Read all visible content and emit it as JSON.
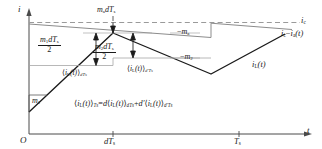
{
  "figure": {
    "type": "technical-waveform-diagram",
    "axes": {
      "y_label": "i",
      "x_label": "t",
      "origin_label": "O",
      "x_ticks": [
        {
          "label_main": "dT",
          "label_sub": "s",
          "value": "dTs"
        },
        {
          "label_main": "T",
          "label_sub": "s",
          "value": "Ts"
        }
      ]
    },
    "curves": [
      {
        "name": "control-current",
        "label_main": "i",
        "label_sub": "c",
        "style": "dashed",
        "color": "#8c8c8c"
      },
      {
        "name": "artificial-ramp-compensated-current",
        "label_text": "ic - ia(t)",
        "label_parts": [
          "i",
          "c",
          "−",
          "i",
          "a",
          "(t)"
        ],
        "style": "solid",
        "color": "#8c8c8c"
      },
      {
        "name": "inductor-current",
        "label_main": "i",
        "label_sub": "L",
        "label_suffix": "(t)",
        "style": "solid",
        "color": "#1a1a1a"
      }
    ],
    "slopes": [
      {
        "name": "rising-slope",
        "label_main": "m",
        "label_sub": "1",
        "sign": ""
      },
      {
        "name": "falling-slope",
        "label_main": "m",
        "label_sub": "2",
        "sign": "−"
      },
      {
        "name": "artificial-ramp-slope",
        "label_main": "m",
        "label_sub": "a",
        "sign": "−"
      }
    ],
    "annotations": {
      "ramp_offset": {
        "name": "artificial-ramp-offset",
        "m": "m",
        "m_sub": "a",
        "d": "d",
        "T": "T",
        "T_sub": "s"
      },
      "ripple_1": {
        "name": "first-subinterval-half-ripple",
        "numerator": {
          "m": "m",
          "m_sub": "1",
          "d": "d",
          "T": "T",
          "T_sub": "s"
        },
        "denominator": "2"
      },
      "ripple_2": {
        "name": "second-subinterval-half-ripple",
        "numerator": {
          "m": "m",
          "m_sub": "2",
          "d": "d",
          "T": "T",
          "T_sub": "s"
        },
        "denominator": "2"
      },
      "avg_d": {
        "name": "average-over-dTs",
        "open": "⟨",
        "i": "i",
        "i_sub": "L",
        "t": "(t)",
        "close": "⟩",
        "sub": "dT",
        "sub_s": "s"
      },
      "avg_dprime": {
        "name": "average-over-dprimeTs",
        "open": "⟨",
        "i": "i",
        "i_sub": "L",
        "t": "(t)",
        "close": "⟩",
        "sub": "d′T",
        "sub_s": "s"
      }
    },
    "equation": {
      "name": "switching-period-average-equation",
      "lhs": {
        "open": "⟨",
        "i": "i",
        "i_sub": "L",
        "t": "(t)",
        "close": "⟩",
        "sub": "T",
        "sub_s": "s"
      },
      "eq": "=",
      "term1": {
        "coef": "d",
        "open": "⟨",
        "i": "i",
        "i_sub": "L",
        "t": "(t)",
        "close": "⟩",
        "sub": "dT",
        "sub_s": "s"
      },
      "plus": "+",
      "term2": {
        "coef": "d′",
        "open": "⟨",
        "i": "i",
        "i_sub": "L",
        "t": "(t)",
        "close": "⟩",
        "sub": "d′T",
        "sub_s": "s"
      }
    },
    "colors": {
      "axis": "#4a4a4a",
      "ink": "#1a1a1a",
      "gray_curve": "#8c8c8c",
      "dash_curve": "#9a9a9a",
      "thin_gray": "#a6a6a6",
      "background": "#ffffff"
    }
  }
}
